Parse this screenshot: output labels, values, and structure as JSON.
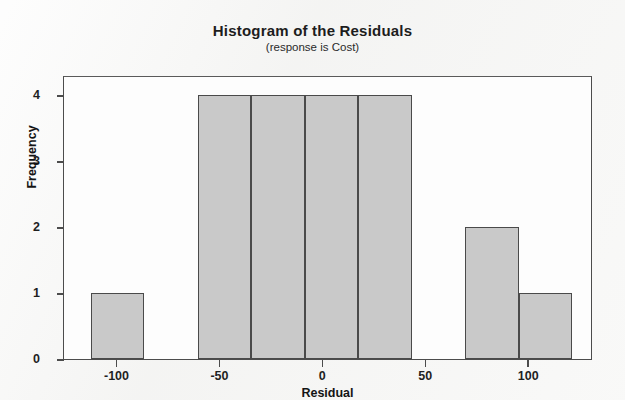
{
  "chart_data": {
    "type": "bar",
    "title": "Histogram of the Residuals",
    "subtitle": "(response is Cost)",
    "xlabel": "Residual",
    "ylabel": "Frequency",
    "xlim": [
      -126,
      131
    ],
    "ylim": [
      0,
      4.3
    ],
    "grid": false,
    "legend": null,
    "bin_width": 26,
    "bin_edges": [
      -113,
      -87,
      -61,
      -35,
      -9,
      17,
      43,
      69,
      95,
      121
    ],
    "categories": [
      "-113 to -87",
      "-87 to -61",
      "-61 to -35",
      "-35 to -9",
      "-9 to 17",
      "17 to 43",
      "43 to 69",
      "69 to 95",
      "95 to 121"
    ],
    "values": [
      1,
      0,
      4,
      4,
      4,
      4,
      0,
      2,
      1
    ],
    "bars": [
      {
        "left": -113,
        "right": -87,
        "height": 1
      },
      {
        "left": -61,
        "right": -35,
        "height": 4
      },
      {
        "left": -35,
        "right": -9,
        "height": 4
      },
      {
        "left": -9,
        "right": 17,
        "height": 4
      },
      {
        "left": 17,
        "right": 43,
        "height": 4
      },
      {
        "left": 69,
        "right": 95,
        "height": 2
      },
      {
        "left": 95,
        "right": 121,
        "height": 1
      }
    ],
    "xticks": [
      -100,
      -50,
      0,
      50,
      100
    ],
    "xtick_labels": [
      "-100",
      "-50",
      "0",
      "50",
      "100"
    ],
    "yticks": [
      0,
      1,
      2,
      3,
      4
    ],
    "ytick_labels": [
      "0",
      "1",
      "2",
      "3",
      "4"
    ],
    "colors": {
      "bar_fill": "#c9c9c9",
      "bar_edge": "#4a4a4a",
      "axis": "#4c4c4c",
      "text": "#1d1d1d",
      "background": "#f4f4f3",
      "plot_background": "#fdfdfd"
    }
  }
}
